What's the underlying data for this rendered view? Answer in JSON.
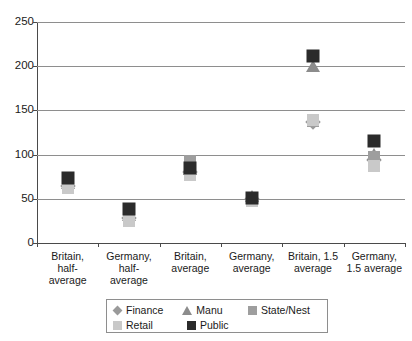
{
  "chart_data": {
    "type": "scatter",
    "title": "",
    "xlabel": "",
    "ylabel": "",
    "ylim": [
      0,
      250
    ],
    "ytick_step": 50,
    "grid": true,
    "legend_position": "bottom",
    "categories": [
      "Britain, half-average",
      "Germany, half-average",
      "Britain, average",
      "Germany, average",
      "Britain, 1.5 average",
      "Germany, 1.5 average"
    ],
    "category_lines": [
      [
        "Britain,",
        "half-",
        "average"
      ],
      [
        "Germany,",
        "half-",
        "average"
      ],
      [
        "Britain,",
        "average"
      ],
      [
        "Germany,",
        "average"
      ],
      [
        "Britain, 1.5",
        "average"
      ],
      [
        "Germany,",
        "1.5 average"
      ]
    ],
    "ytick_labels": [
      "250",
      "200",
      "150",
      "100",
      "50",
      "0"
    ],
    "ytick_values": [
      250,
      200,
      150,
      100,
      50,
      0
    ],
    "series": [
      {
        "name": "Finance",
        "marker": "diamond",
        "color": "#9a9a9a",
        "values": [
          64,
          28,
          80,
          50,
          137,
          94
        ]
      },
      {
        "name": "Manu",
        "marker": "triangle",
        "color": "#8c8c8c",
        "values": [
          67,
          31,
          83,
          52,
          199,
          99
        ]
      },
      {
        "name": "State/Nest",
        "marker": "square",
        "color": "#9e9e9e",
        "values": [
          68,
          30,
          93,
          50,
          138,
          97
        ]
      },
      {
        "name": "Retail",
        "marker": "square",
        "color": "#c9c9c9",
        "values": [
          62,
          25,
          77,
          48,
          139,
          87
        ]
      },
      {
        "name": "Public",
        "marker": "square",
        "color": "#2b2b2b",
        "values": [
          74,
          38,
          85,
          51,
          211,
          115
        ]
      }
    ],
    "legend_entries": [
      {
        "label": "Finance",
        "marker": "diamond",
        "color": "#9a9a9a"
      },
      {
        "label": "Manu",
        "marker": "triangle",
        "color": "#8c8c8c"
      },
      {
        "label": "State/Nest",
        "marker": "square",
        "color": "#9e9e9e"
      },
      {
        "label": "Retail",
        "marker": "square",
        "color": "#c9c9c9"
      },
      {
        "label": "Public",
        "marker": "square",
        "color": "#2b2b2b"
      }
    ]
  }
}
